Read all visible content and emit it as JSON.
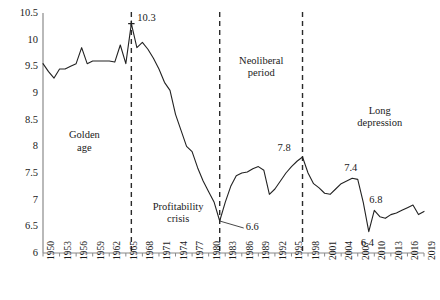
{
  "chart_data": {
    "type": "line",
    "title": "",
    "subtitle": "",
    "xlabel": "",
    "ylabel": "",
    "grid": false,
    "legend": "none",
    "xlim": [
      1950,
      2019
    ],
    "ylim": [
      6,
      10.5
    ],
    "ytick_labels": [
      "10.5",
      "10",
      "9.5",
      "9",
      "8.5",
      "8",
      "7.5",
      "7",
      "6.5",
      "6"
    ],
    "ytick_values": [
      10.5,
      10,
      9.5,
      9,
      8.5,
      8,
      7.5,
      7,
      6.5,
      6
    ],
    "xtick_labels": [
      "1950",
      "1953",
      "1956",
      "1959",
      "1962",
      "1965",
      "1968",
      "1971",
      "1974",
      "1977",
      "1980",
      "1983",
      "1986",
      "1989",
      "1992",
      "1995",
      "1998",
      "2001",
      "2004",
      "2007",
      "2010",
      "2013",
      "2016",
      "2019"
    ],
    "xtick_values": [
      1950,
      1953,
      1956,
      1959,
      1962,
      1965,
      1968,
      1971,
      1974,
      1977,
      1980,
      1983,
      1986,
      1989,
      1992,
      1995,
      1998,
      2001,
      2004,
      2007,
      2010,
      2013,
      2016,
      2019
    ],
    "series": [
      {
        "name": "rate of profit",
        "color": "#222222",
        "x": [
          1950,
          1951,
          1952,
          1953,
          1954,
          1955,
          1956,
          1957,
          1958,
          1959,
          1960,
          1961,
          1962,
          1963,
          1964,
          1965,
          1966,
          1967,
          1968,
          1969,
          1970,
          1971,
          1972,
          1973,
          1974,
          1975,
          1976,
          1977,
          1978,
          1979,
          1980,
          1981,
          1982,
          1983,
          1984,
          1985,
          1986,
          1987,
          1988,
          1989,
          1990,
          1991,
          1992,
          1993,
          1994,
          1995,
          1996,
          1997,
          1998,
          1999,
          2000,
          2001,
          2002,
          2003,
          2004,
          2005,
          2006,
          2007,
          2008,
          2009,
          2010,
          2011,
          2012,
          2013,
          2014,
          2015,
          2016,
          2017,
          2018,
          2019
        ],
        "y": [
          9.55,
          9.4,
          9.28,
          9.45,
          9.45,
          9.5,
          9.55,
          9.85,
          9.55,
          9.6,
          9.6,
          9.6,
          9.6,
          9.58,
          9.9,
          9.55,
          10.3,
          9.85,
          9.95,
          9.82,
          9.65,
          9.45,
          9.2,
          9.05,
          8.6,
          8.3,
          8.0,
          7.9,
          7.6,
          7.35,
          7.15,
          6.95,
          6.6,
          6.95,
          7.25,
          7.45,
          7.5,
          7.52,
          7.58,
          7.62,
          7.55,
          7.1,
          7.2,
          7.35,
          7.5,
          7.62,
          7.72,
          7.8,
          7.5,
          7.3,
          7.22,
          7.12,
          7.1,
          7.2,
          7.3,
          7.35,
          7.4,
          7.38,
          6.95,
          6.4,
          6.8,
          6.68,
          6.65,
          6.72,
          6.75,
          6.8,
          6.85,
          6.9,
          6.72,
          6.78
        ]
      }
    ],
    "dividers": [
      {
        "id": "divider-1966",
        "x": 1966
      },
      {
        "id": "divider-1982",
        "x": 1982
      },
      {
        "id": "divider-1997",
        "x": 1997
      }
    ],
    "period_labels": [
      {
        "id": "golden-age",
        "text": "Golden\nage",
        "line1": "Golden",
        "line2": "age",
        "x": 1957.5,
        "y": 8.32
      },
      {
        "id": "profitability-crisis",
        "text": "Profitability\ncrisis",
        "line1": "Profitability",
        "line2": "crisis",
        "x": 1974.5,
        "y": 6.98
      },
      {
        "id": "neoliberal-period",
        "text": "Neoliberal\nperiod",
        "line1": "Neoliberal",
        "line2": "period",
        "x": 1989.5,
        "y": 9.72
      },
      {
        "id": "long-depression",
        "text": "Long\ndepression",
        "line1": "Long",
        "line2": "depression",
        "x": 2011,
        "y": 8.78
      }
    ],
    "annotations": [
      {
        "id": "peak-1966",
        "label": "10.3",
        "x": 1966,
        "y": 10.3,
        "marker": true,
        "leader": false
      },
      {
        "id": "trough-1982",
        "label": "6.6",
        "x": 1982,
        "y": 6.6,
        "marker": false,
        "leader": true
      },
      {
        "id": "peak-1997",
        "label": "7.8",
        "x": 1997,
        "y": 7.8,
        "marker": false,
        "leader": false
      },
      {
        "id": "peak-2006",
        "label": "7.4",
        "x": 2006,
        "y": 7.4,
        "marker": false,
        "leader": false
      },
      {
        "id": "trough-2009",
        "label": "6.4",
        "x": 2009,
        "y": 6.4,
        "marker": false,
        "leader": false
      },
      {
        "id": "peak-2010",
        "label": "6.8",
        "x": 2010,
        "y": 6.8,
        "marker": false,
        "leader": false
      }
    ]
  }
}
